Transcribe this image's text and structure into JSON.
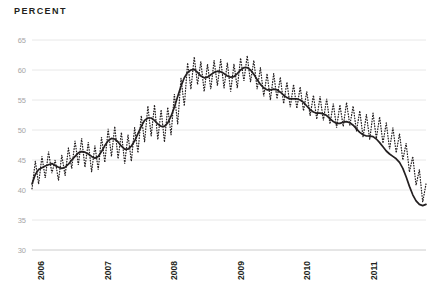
{
  "chart_data": {
    "type": "line",
    "title": "PERCENT",
    "xlabel": "",
    "ylabel": "Percent",
    "ylim": [
      30,
      65
    ],
    "xlim": [
      2006.0,
      2011.92
    ],
    "yticks": [
      30,
      35,
      40,
      45,
      50,
      55,
      60,
      65
    ],
    "ytick_labels": [
      "30",
      "35",
      "40",
      "45",
      "50",
      "55",
      "60",
      "65"
    ],
    "xticks": [
      2006,
      2007,
      2008,
      2009,
      2010,
      2011
    ],
    "xtick_labels": [
      "2006",
      "2007",
      "2008",
      "2009",
      "2010",
      "2011"
    ],
    "grid": true,
    "grid_axis": "y",
    "legend": "none",
    "series": [
      {
        "name": "smoothed-trend",
        "style": "solid",
        "color": "#231f20",
        "values": [
          41.0,
          42.6,
          43.4,
          43.7,
          44.0,
          44.2,
          44.4,
          44.1,
          43.8,
          43.6,
          43.8,
          44.3,
          45.0,
          45.6,
          46.2,
          46.4,
          46.3,
          46.0,
          45.6,
          45.3,
          45.6,
          46.4,
          47.4,
          48.2,
          48.6,
          48.5,
          48.0,
          47.3,
          46.8,
          46.8,
          47.3,
          48.2,
          49.4,
          50.6,
          51.6,
          52.0,
          52.0,
          51.6,
          51.0,
          50.6,
          50.6,
          51.2,
          52.3,
          53.8,
          55.6,
          57.3,
          58.7,
          59.6,
          60.0,
          60.1,
          59.6,
          59.0,
          58.7,
          58.8,
          59.2,
          59.6,
          59.8,
          59.7,
          59.4,
          59.0,
          58.8,
          58.9,
          59.4,
          60.0,
          60.4,
          60.4,
          60.0,
          59.3,
          58.4,
          57.6,
          57.0,
          56.7,
          56.7,
          56.8,
          56.7,
          56.3,
          55.8,
          55.4,
          55.2,
          55.2,
          55.2,
          55.0,
          54.6,
          54.0,
          53.4,
          53.0,
          52.8,
          52.8,
          52.7,
          52.4,
          51.9,
          51.4,
          51.1,
          51.1,
          51.3,
          51.4,
          51.2,
          50.8,
          50.2,
          49.6,
          49.2,
          49.0,
          49.0,
          48.9,
          48.5,
          47.9,
          47.2,
          46.5,
          46.0,
          45.6,
          45.2,
          44.6,
          43.6,
          42.2,
          40.6,
          39.2,
          38.2,
          37.6,
          37.4,
          37.6
        ]
      },
      {
        "name": "raw-monthly",
        "style": "dotted",
        "color": "#231f20",
        "values": [
          40.2,
          44.8,
          41.0,
          45.6,
          42.0,
          46.4,
          42.8,
          45.0,
          41.6,
          45.8,
          42.4,
          47.0,
          43.6,
          48.2,
          44.2,
          48.6,
          43.8,
          48.0,
          43.0,
          47.4,
          43.4,
          48.8,
          44.6,
          50.2,
          45.6,
          50.6,
          45.2,
          49.6,
          44.4,
          49.2,
          44.8,
          50.4,
          46.2,
          52.4,
          48.0,
          54.0,
          49.0,
          54.2,
          48.4,
          53.4,
          48.0,
          53.8,
          49.2,
          56.0,
          51.0,
          58.6,
          54.0,
          61.2,
          56.8,
          62.2,
          57.6,
          61.4,
          56.4,
          61.0,
          56.8,
          61.6,
          57.4,
          61.8,
          57.0,
          61.2,
          56.4,
          61.0,
          57.0,
          62.0,
          58.2,
          62.4,
          58.0,
          61.6,
          56.8,
          60.4,
          55.6,
          59.4,
          55.0,
          59.4,
          55.2,
          58.8,
          54.4,
          58.0,
          53.8,
          57.6,
          53.6,
          57.2,
          53.2,
          56.4,
          52.4,
          55.8,
          51.8,
          55.6,
          51.6,
          55.2,
          51.0,
          54.4,
          50.4,
          54.2,
          50.6,
          54.6,
          50.8,
          54.0,
          49.8,
          53.2,
          48.8,
          52.6,
          48.4,
          52.8,
          48.6,
          52.2,
          47.8,
          51.2,
          46.8,
          50.4,
          46.2,
          49.4,
          45.0,
          47.8,
          43.0,
          45.6,
          40.8,
          43.4,
          38.0,
          41.0
        ]
      }
    ],
    "x_start": 2006.0,
    "x_step": 0.0505
  },
  "axes": {
    "y_axis_name": "y-axis",
    "x_axis_name": "x-axis"
  }
}
